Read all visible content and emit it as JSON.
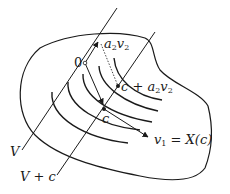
{
  "diagram": {
    "type": "manifold-flow-figure",
    "labels": {
      "origin": "0",
      "a2v2_a": "a",
      "a2v2_sub1": "2",
      "a2v2_v": "v",
      "a2v2_sub2": "2",
      "c_plus_pre": "c + a",
      "c_plus_sub1": "2",
      "c_plus_v": "v",
      "c_plus_sub2": "2",
      "c": "c",
      "v1_v": "v",
      "v1_sub": "1",
      "v1_rest": " = X(c)",
      "V": "V",
      "V_plus_c": "V + c"
    },
    "colors": {
      "stroke": "#1a1a1a"
    }
  }
}
